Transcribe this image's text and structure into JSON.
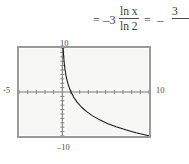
{
  "equation": {
    "equals_1": "=",
    "coefficient_1": "–3",
    "fraction_1": {
      "numerator": "ln x",
      "denominator": "ln 2"
    },
    "equals_2": "=",
    "coefficient_2": "–",
    "fraction_2": {
      "numerator": "3",
      "denominator": ""
    }
  },
  "graph": {
    "labels": {
      "y_max": "10",
      "x_min": "-5",
      "x_max": "10",
      "y_min": "–10"
    },
    "colors": {
      "curve": "#1a1a1a",
      "axis": "#6e6e6e",
      "frame": "#8e8e8e",
      "screen_fill": "#f7f7f5"
    }
  },
  "chart_data": {
    "type": "line",
    "title": "",
    "xlabel": "",
    "ylabel": "",
    "xlim": [
      -5,
      10
    ],
    "ylim": [
      -10,
      10
    ],
    "grid": false,
    "legend": null,
    "tick_labels": {
      "top": "10",
      "left": "-5",
      "right": "10",
      "bottom": "-10"
    },
    "x_tick_spacing": 1,
    "y_tick_spacing": 1,
    "series": [
      {
        "name": "y = -3 ln x / ln 2",
        "x": [
          0.06,
          0.08,
          0.1,
          0.13,
          0.17,
          0.22,
          0.3,
          0.4,
          0.5,
          0.63,
          0.8,
          1.0,
          1.3,
          1.7,
          2.2,
          2.8,
          3.5,
          4.3,
          5.2,
          6.2,
          7.3,
          8.5,
          9.6,
          10.0
        ],
        "y": [
          12.18,
          10.93,
          9.97,
          8.83,
          7.67,
          6.56,
          5.21,
          3.97,
          3.0,
          2.0,
          0.97,
          0.0,
          -1.14,
          -2.3,
          -3.41,
          -4.46,
          -5.42,
          -6.33,
          -7.14,
          -7.9,
          -8.6,
          -9.26,
          -9.79,
          -9.97
        ]
      }
    ]
  }
}
